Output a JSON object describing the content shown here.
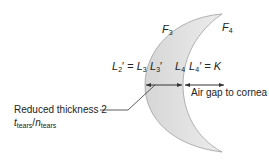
{
  "labels": {
    "f3": {
      "sym": "F",
      "sub": "3"
    },
    "f4": {
      "sym": "F",
      "sub": "4"
    },
    "l2p": {
      "sym": "L",
      "sub": "2",
      "suffix": "′ ="
    },
    "l3": {
      "sym": "L",
      "sub": "3"
    },
    "l3p": {
      "sym": "L",
      "sub": "3",
      "suffix": "′"
    },
    "l4": {
      "sym": "L",
      "sub": "4"
    },
    "l4p": {
      "sym": "L",
      "sub": "4",
      "suffix": "′ = K"
    },
    "air_gap": "Air gap to cornea",
    "reduced_thickness": "Reduced thickness 2",
    "t_tears": {
      "sym": "t",
      "sub": "tears"
    },
    "n_tears": {
      "sym": "n",
      "sub": "tears"
    },
    "slash": "/"
  },
  "colors": {
    "lens_fill": "#e3e3e3",
    "lens_stroke": "#9a9a9a",
    "line": "#333333"
  }
}
